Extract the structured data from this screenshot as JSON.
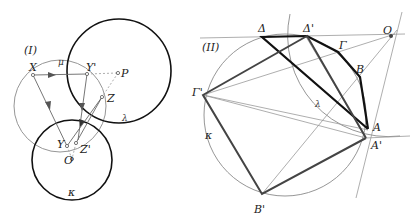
{
  "figure_I": {
    "label": "(I)",
    "points": {
      "X": "X",
      "Y": "Y",
      "Y_prime": "Y'",
      "P": "P",
      "Z": "Z",
      "Z_prime": "Z'",
      "O": "O"
    },
    "circles": {
      "mu": "μ",
      "lambda": "λ",
      "kappa": "κ"
    }
  },
  "figure_II": {
    "label": "(II)",
    "points": {
      "Delta": "Δ",
      "Delta_prime": "Δ'",
      "O": "O",
      "Gamma": "Γ",
      "B": "B",
      "A": "A",
      "A_prime": "A'",
      "Gamma_prime": "Γ'",
      "B_prime": "B'"
    },
    "circles": {
      "lambda": "λ",
      "kappa": "κ"
    }
  },
  "colors": {
    "thick": "#111111",
    "thin": "#8a8a8a",
    "medium": "#444444"
  }
}
